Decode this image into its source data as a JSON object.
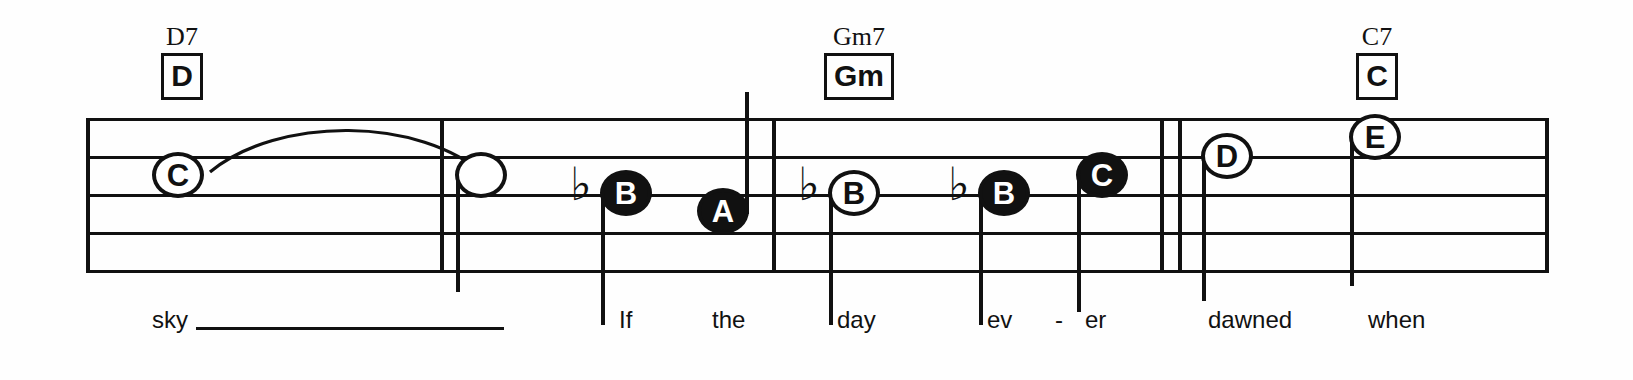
{
  "document": {
    "type": "lead-sheet-music-notation",
    "system_index": 1,
    "lyrics_line": "sky ______ If the day ev - er dawned when"
  },
  "chords": [
    {
      "symbol": "D7",
      "box_label": "D",
      "x": 182
    },
    {
      "symbol": "Gm7",
      "box_label": "Gm",
      "x": 859
    },
    {
      "symbol": "C7",
      "box_label": "C",
      "x": 1377
    }
  ],
  "staff": {
    "line_count": 5,
    "left": 86,
    "right": 1548,
    "top": 118,
    "bottom": 270,
    "line_spacing": 38
  },
  "barlines": [
    {
      "name": "barline-1",
      "x": 440,
      "top": 118,
      "bottom": 270
    },
    {
      "name": "barline-2",
      "x": 772,
      "top": 118,
      "bottom": 270
    },
    {
      "name": "double-barline-a",
      "x": 1160,
      "top": 118,
      "bottom": 270
    },
    {
      "name": "double-barline-b",
      "x": 1178,
      "top": 118,
      "bottom": 270
    }
  ],
  "notes": [
    {
      "name": "note-c-tied",
      "letter": "C",
      "style": "open",
      "x": 152,
      "y": 152,
      "stem": "none",
      "accidental": ""
    },
    {
      "name": "note-tie-end",
      "letter": "",
      "style": "blank",
      "x": 455,
      "y": 152,
      "stem": "down",
      "stem_len": 120,
      "accidental": ""
    },
    {
      "name": "note-b-flat-1",
      "letter": "B",
      "style": "filled",
      "x": 600,
      "y": 170,
      "stem": "down",
      "stem_len": 135,
      "accidental": "b"
    },
    {
      "name": "note-a",
      "letter": "A",
      "style": "filled",
      "x": 697,
      "y": 188,
      "stem": "up",
      "stem_len": 122,
      "accidental": ""
    },
    {
      "name": "note-b-flat-2",
      "letter": "B",
      "style": "open",
      "x": 828,
      "y": 170,
      "stem": "down",
      "stem_len": 135,
      "accidental": "b"
    },
    {
      "name": "note-b-flat-3",
      "letter": "B",
      "style": "filled",
      "x": 978,
      "y": 170,
      "stem": "down",
      "stem_len": 135,
      "accidental": "b"
    },
    {
      "name": "note-c-high",
      "letter": "C",
      "style": "filled",
      "x": 1076,
      "y": 152,
      "stem": "down",
      "stem_len": 140,
      "accidental": ""
    },
    {
      "name": "note-d",
      "letter": "D",
      "style": "open",
      "x": 1201,
      "y": 133,
      "stem": "down",
      "stem_len": 148,
      "accidental": ""
    },
    {
      "name": "note-e",
      "letter": "E",
      "style": "open",
      "x": 1349,
      "y": 114,
      "stem": "down",
      "stem_len": 152,
      "accidental": ""
    }
  ],
  "tie": {
    "name": "tie-slur",
    "from_x": 208,
    "to_x": 480,
    "apex_y": 128
  },
  "lyrics": [
    {
      "text": "sky",
      "x": 152,
      "melisma": {
        "from": 196,
        "to": 504
      }
    },
    {
      "text": "If",
      "x": 619,
      "melisma": null
    },
    {
      "text": "the",
      "x": 712,
      "melisma": null
    },
    {
      "text": "day",
      "x": 837,
      "melisma": null
    },
    {
      "text": "ev",
      "x": 987,
      "melisma": null
    },
    {
      "text": "-",
      "x": 1055,
      "melisma": null
    },
    {
      "text": "er",
      "x": 1085,
      "melisma": null
    },
    {
      "text": "dawned",
      "x": 1208,
      "melisma": null
    },
    {
      "text": "when",
      "x": 1368,
      "melisma": null
    }
  ],
  "colors": {
    "ink": "#111111",
    "paper": "#fefefe"
  }
}
